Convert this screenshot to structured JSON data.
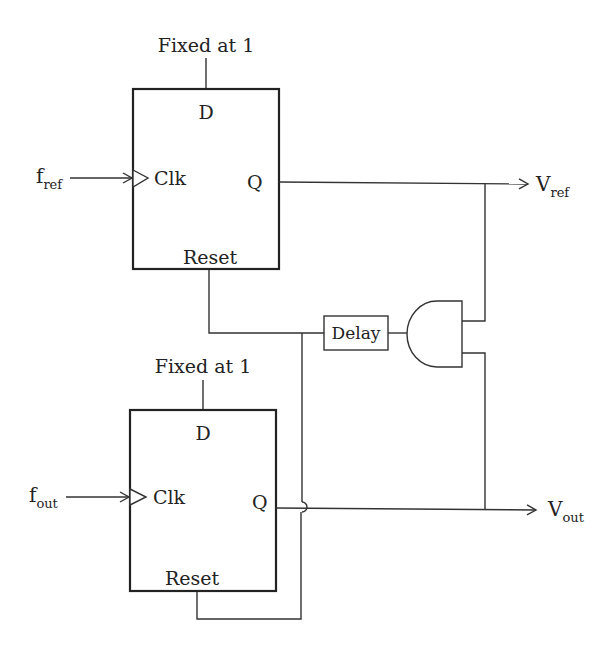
{
  "diagram": {
    "type": "phase-frequency detector schematic",
    "flipflop_top": {
      "d_input_label": "Fixed at 1",
      "d_pin": "D",
      "clk_pin": "Clk",
      "q_pin": "Q",
      "reset_pin": "Reset",
      "clock_input": {
        "main": "f",
        "sub": "ref"
      },
      "output": {
        "main": "V",
        "sub": "ref"
      }
    },
    "flipflop_bottom": {
      "d_input_label": "Fixed at 1",
      "d_pin": "D",
      "clk_pin": "Clk",
      "q_pin": "Q",
      "reset_pin": "Reset",
      "clock_input": {
        "main": "f",
        "sub": "out"
      },
      "output": {
        "main": "V",
        "sub": "out"
      }
    },
    "delay_label": "Delay",
    "and_gate": "AND",
    "colors": {
      "line": "#333333",
      "text": "#222222",
      "background": "#ffffff"
    }
  }
}
